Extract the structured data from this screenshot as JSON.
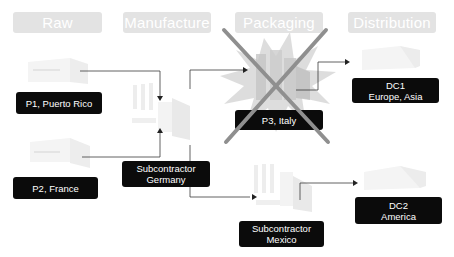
{
  "headers": {
    "raw_materials": "Raw Materials",
    "manufacture": "Manufacture",
    "packaging": "Packaging",
    "distribution": "Distribution"
  },
  "nodes": {
    "p1": {
      "line1": "P1, Puerto Rico"
    },
    "p2": {
      "line1": "P2, France"
    },
    "sub_germany": {
      "line1": "Subcontractor",
      "line2": "Germany"
    },
    "p3": {
      "line1": "P3, Italy",
      "status": "disrupted"
    },
    "dc1": {
      "line1": "DC1",
      "line2": "Europe, Asia"
    },
    "dc2": {
      "line1": "DC2",
      "line2": "America"
    },
    "sub_mexico": {
      "line1": "Subcontractor",
      "line2": "Mexico"
    }
  },
  "icons": {
    "factory": "factory-icon",
    "warehouse": "warehouse-icon",
    "disruption": "explosion-icon",
    "cross": "cross-out-icon"
  },
  "colors": {
    "header_bg": "#e3e3e3",
    "label_bg": "#0b0b0b",
    "label_text": "#ffffff",
    "connector": "#3a3a3a",
    "burst": "#d6d6d6",
    "cross": "#8a8a8a"
  }
}
